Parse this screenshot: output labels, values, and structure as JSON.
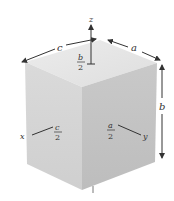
{
  "figure": {
    "type": "rectangular box with coordinate axes through center",
    "colors": {
      "top_face": "#e6e6e6",
      "left_face": "#d4d4d4",
      "right_face": "#c4c4c4",
      "lines": "#333333",
      "background": "#ffffff"
    },
    "axes": {
      "z": "z",
      "x": "x",
      "y": "y"
    },
    "dimensions": {
      "width_label": "c",
      "depth_label": "a",
      "height_label": "b"
    },
    "half_labels": {
      "b_half": {
        "num": "b",
        "den": "2"
      },
      "c_half": {
        "num": "c",
        "den": "2"
      },
      "a_half": {
        "num": "a",
        "den": "2"
      }
    }
  }
}
